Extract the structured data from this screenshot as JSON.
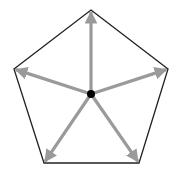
{
  "diagram": {
    "type": "pentagon-vectors",
    "background": "#ffffff",
    "outline_color": "#222222",
    "arrow_color": "#9a9a9a",
    "center_color": "#000000",
    "center": [
      91,
      94
    ],
    "vertices": [
      {
        "name": "top",
        "x": 91,
        "y": 10
      },
      {
        "name": "right",
        "x": 168,
        "y": 69
      },
      {
        "name": "bottom-right",
        "x": 139,
        "y": 163
      },
      {
        "name": "bottom-left",
        "x": 44,
        "y": 163
      },
      {
        "name": "left",
        "x": 14,
        "y": 69
      }
    ]
  }
}
